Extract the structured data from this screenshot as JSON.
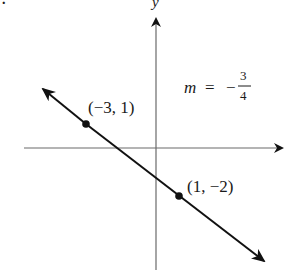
{
  "figure": {
    "part_label_fragment": ".",
    "axes": {
      "x_label": "x",
      "y_label": "y",
      "color": "#6a6a6a"
    },
    "line": {
      "color": "#1a1a1a",
      "slope_label": {
        "variable": "m",
        "equals": "=",
        "sign": "−",
        "numerator": "3",
        "denominator": "4"
      }
    },
    "points": [
      {
        "label": "(−3, 1)",
        "x": -3,
        "y": 1
      },
      {
        "label": "(1, −2)",
        "x": 1,
        "y": -2
      }
    ]
  }
}
